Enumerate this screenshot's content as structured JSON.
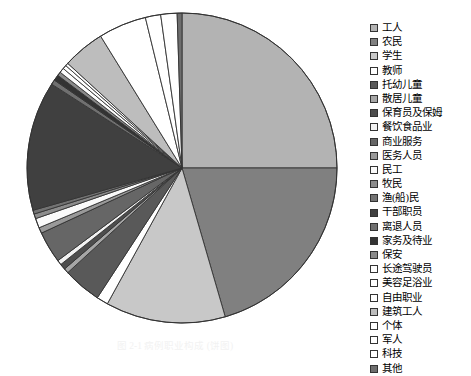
{
  "figure": {
    "caption": "图 2-1  病例职业构成 (饼图)",
    "background_color": "#ffffff",
    "outline_color": "#333333"
  },
  "legend": {
    "position": "right",
    "items": [
      {
        "label": "工人",
        "color": "#b3b3b3"
      },
      {
        "label": "农民",
        "color": "#808080"
      },
      {
        "label": "学生",
        "color": "#c8c8c8"
      },
      {
        "label": "教师",
        "color": "#ffffff"
      },
      {
        "label": "托幼儿童",
        "color": "#595959"
      },
      {
        "label": "散居儿童",
        "color": "#a6a6a6"
      },
      {
        "label": "保育员及保姆",
        "color": "#4d4d4d"
      },
      {
        "label": "餐饮食品业",
        "color": "#f2f2f2"
      },
      {
        "label": "商业服务",
        "color": "#666666"
      },
      {
        "label": "医务人员",
        "color": "#999999"
      },
      {
        "label": "民工",
        "color": "#fafafa"
      },
      {
        "label": "牧民",
        "color": "#8c8c8c"
      },
      {
        "label": "渔(船)民",
        "color": "#737373"
      },
      {
        "label": "干部职员",
        "color": "#404040"
      },
      {
        "label": "离退人员",
        "color": "#707070"
      },
      {
        "label": "家务及待业",
        "color": "#333333"
      },
      {
        "label": "保安",
        "color": "#8a8a8a"
      },
      {
        "label": "长途驾驶员",
        "color": "#fdfdfd"
      },
      {
        "label": "美容足浴业",
        "color": "#ffffff"
      },
      {
        "label": "自由职业",
        "color": "#ffffff"
      },
      {
        "label": "建筑工人",
        "color": "#bdbdbd"
      },
      {
        "label": "个体",
        "color": "#ffffff"
      },
      {
        "label": "军人",
        "color": "#ffffff"
      },
      {
        "label": "科技",
        "color": "#ffffff"
      },
      {
        "label": "其他",
        "color": "#6e6e6e"
      }
    ]
  },
  "chart_data": {
    "type": "pie",
    "title": "",
    "start_angle_deg": 0,
    "direction": "clockwise",
    "center": [
      168,
      162
    ],
    "radius": 155,
    "labels": [
      "工人",
      "农民",
      "学生",
      "教师",
      "托幼儿童",
      "散居儿童",
      "保育员及保姆",
      "餐饮食品业",
      "商业服务",
      "医务人员",
      "民工",
      "牧民",
      "渔(船)民",
      "干部职员",
      "离退人员",
      "家务及待业",
      "保安",
      "长途驾驶员",
      "美容足浴业",
      "自由职业",
      "建筑工人",
      "个体",
      "军人",
      "科技",
      "其他"
    ],
    "values": [
      25.0,
      20.5,
      12.5,
      1.2,
      4.0,
      0.5,
      0.6,
      0.5,
      3.3,
      0.6,
      1.0,
      0.5,
      0.4,
      13.5,
      0.5,
      0.6,
      0.4,
      0.5,
      0.4,
      0.3,
      4.4,
      5.0,
      1.6,
      1.7,
      0.5
    ],
    "colors": [
      "#b3b3b3",
      "#808080",
      "#c8c8c8",
      "#ffffff",
      "#595959",
      "#a6a6a6",
      "#4d4d4d",
      "#f2f2f2",
      "#666666",
      "#999999",
      "#fafafa",
      "#8c8c8c",
      "#737373",
      "#404040",
      "#707070",
      "#333333",
      "#8a8a8a",
      "#fdfdfd",
      "#ffffff",
      "#ffffff",
      "#bdbdbd",
      "#ffffff",
      "#ffffff",
      "#ffffff",
      "#6e6e6e"
    ],
    "legend_position": "right",
    "grid": false,
    "units": "percent"
  }
}
